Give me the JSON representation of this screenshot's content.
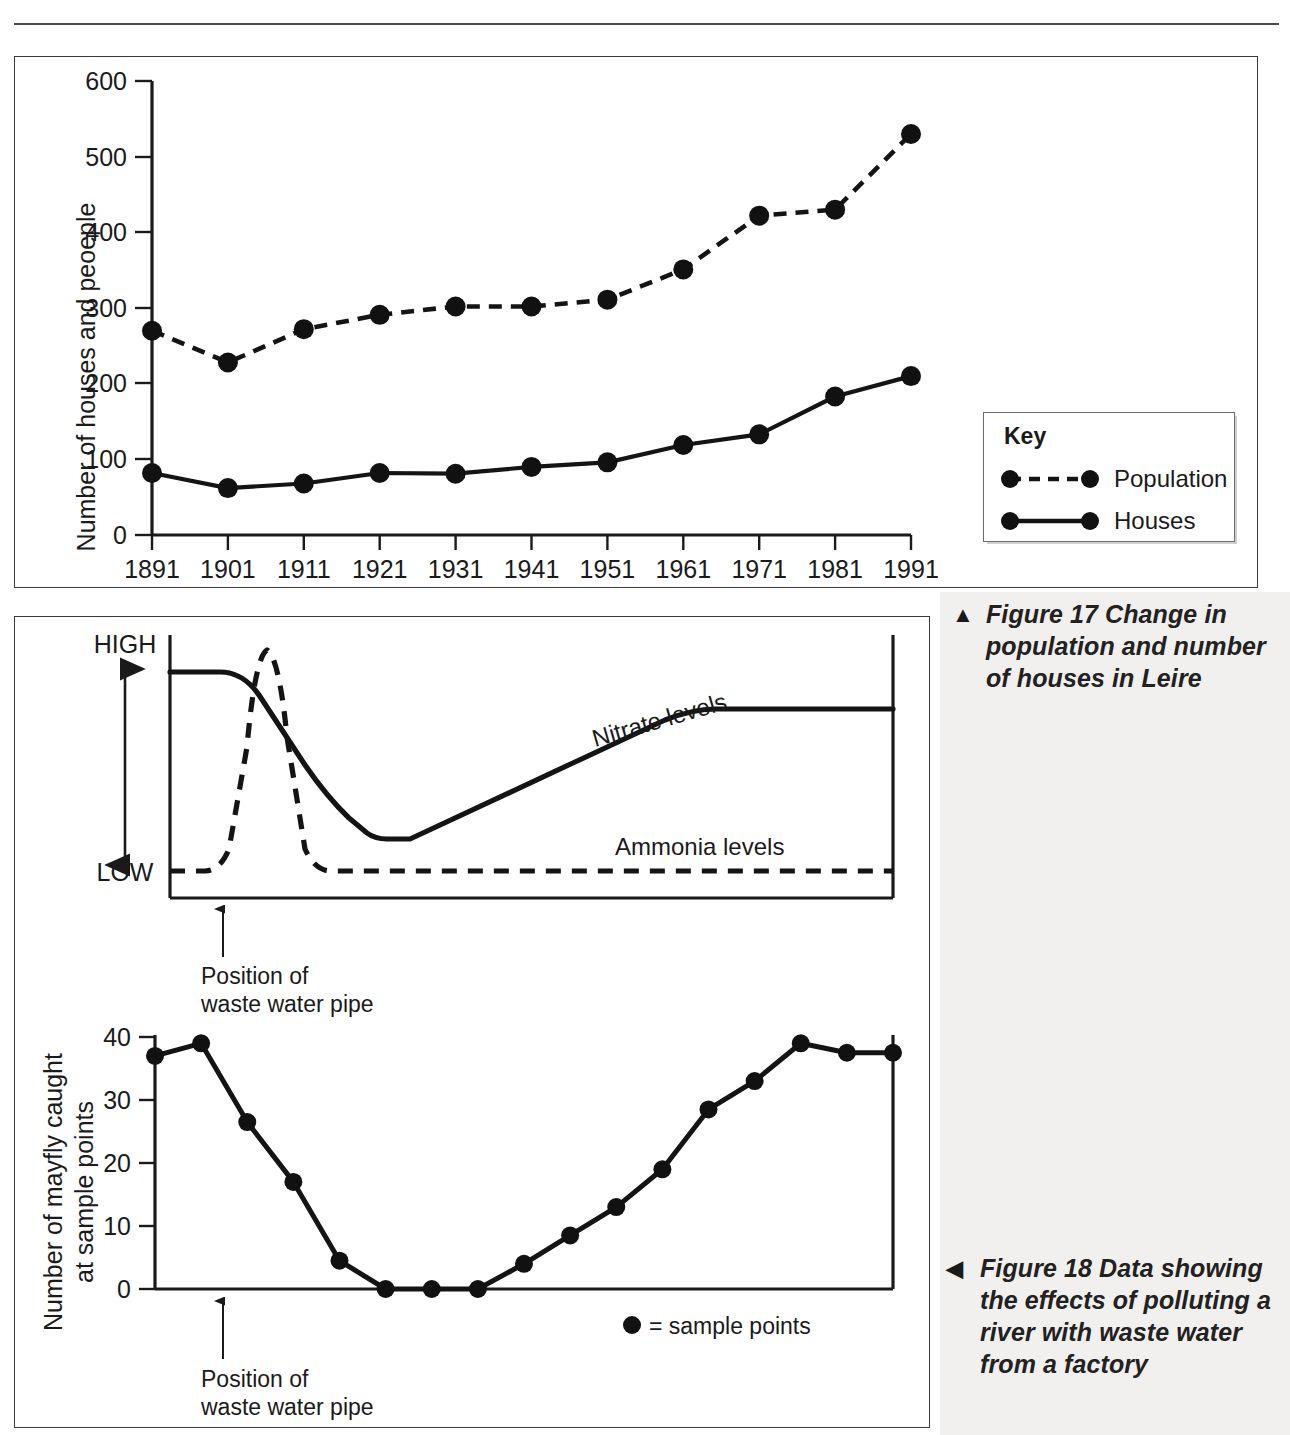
{
  "page": {
    "top_rule": true,
    "right_column_bg": "#f1f0ee"
  },
  "figure17": {
    "caption_marker": "▲",
    "caption_text": "Figure 17 Change in population and number of houses in Leire",
    "key": {
      "title": "Key",
      "items": [
        {
          "label": "Population",
          "style": "dashed",
          "marker": "circle"
        },
        {
          "label": "Houses",
          "style": "solid",
          "marker": "circle"
        }
      ]
    },
    "chart_data": {
      "type": "line",
      "title": "",
      "xlabel": "",
      "ylabel": "Number of houses and peoeple",
      "categories": [
        "1891",
        "1901",
        "1911",
        "1921",
        "1931",
        "1941",
        "1951",
        "1961",
        "1971",
        "1981",
        "1991"
      ],
      "xticklabels": [
        "1891",
        "1901",
        "1911",
        "1921",
        "1931",
        "1941",
        "1951",
        "1961",
        "1971",
        "1981",
        "1991"
      ],
      "yticklabels": [
        "0",
        "100",
        "200",
        "300",
        "400",
        "500",
        "600"
      ],
      "yticks": [
        0,
        100,
        200,
        300,
        400,
        500,
        600
      ],
      "ylim": [
        0,
        600
      ],
      "grid": false,
      "legend": "Key",
      "legend_position": "right",
      "series": [
        {
          "name": "Population",
          "style": "dashed",
          "values": [
            270,
            228,
            272,
            291,
            302,
            302,
            311,
            351,
            422,
            430,
            530
          ]
        },
        {
          "name": "Houses",
          "style": "solid",
          "values": [
            82,
            62,
            68,
            82,
            81,
            90,
            96,
            119,
            133,
            183,
            210
          ]
        }
      ]
    }
  },
  "figure18": {
    "caption_marker": "◀",
    "caption_text": "Figure 18 Data showing the effects of polluting a river with waste water from a factory",
    "sample_legend": "= sample points",
    "upper_chart": {
      "type": "line",
      "title": "",
      "ylabel_high": "HIGH",
      "ylabel_low": "LOW",
      "xlabel": "",
      "grid": false,
      "annotation": "Position of\nwaste water pipe",
      "annotation_line1": "Position of",
      "annotation_line2": "waste water pipe",
      "series": [
        {
          "name": "Nitrate levels",
          "style": "solid",
          "description": "Starts high, falls sharply after the waste water pipe to a minimum, then rises steadily back to high"
        },
        {
          "name": "Ammonia levels",
          "style": "dashed",
          "description": "Low, spikes sharply to a peak at the waste water pipe, then falls back to low and stays low"
        }
      ]
    },
    "lower_chart": {
      "type": "line",
      "title": "",
      "ylabel": "Number of mayfly caught at sample points",
      "xlabel": "",
      "yticks": [
        0,
        10,
        20,
        30,
        40
      ],
      "yticklabels": [
        "0",
        "10",
        "20",
        "30",
        "40"
      ],
      "ylim": [
        0,
        42
      ],
      "grid": false,
      "annotation_line1": "Position of",
      "annotation_line2": "waste water pipe",
      "series": [
        {
          "name": "Number of mayfly caught at sample points",
          "style": "solid",
          "values": [
            37,
            39,
            26.5,
            17,
            4.5,
            0,
            0,
            0,
            4,
            8.5,
            13,
            19,
            28.5,
            33,
            39,
            37.5,
            37.5
          ]
        }
      ]
    }
  }
}
